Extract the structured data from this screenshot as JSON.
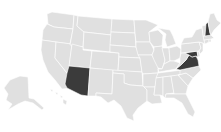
{
  "map": {
    "title": "United States",
    "colors": {
      "background": "#ffffff",
      "default_fill": "#e0e0e0",
      "highlight_fill": "#3b3b3b",
      "border": "#ffffff"
    },
    "highlighted_states": [
      "Arizona",
      "Virginia",
      "Maryland",
      "New Hampshire"
    ],
    "states": [
      {
        "id": "WA",
        "name": "Washington",
        "highlighted": false
      },
      {
        "id": "OR",
        "name": "Oregon",
        "highlighted": false
      },
      {
        "id": "CA",
        "name": "California",
        "highlighted": false
      },
      {
        "id": "NV",
        "name": "Nevada",
        "highlighted": false
      },
      {
        "id": "ID",
        "name": "Idaho",
        "highlighted": false
      },
      {
        "id": "MT",
        "name": "Montana",
        "highlighted": false
      },
      {
        "id": "WY",
        "name": "Wyoming",
        "highlighted": false
      },
      {
        "id": "UT",
        "name": "Utah",
        "highlighted": false
      },
      {
        "id": "AZ",
        "name": "Arizona",
        "highlighted": true
      },
      {
        "id": "CO",
        "name": "Colorado",
        "highlighted": false
      },
      {
        "id": "NM",
        "name": "New Mexico",
        "highlighted": false
      },
      {
        "id": "ND",
        "name": "North Dakota",
        "highlighted": false
      },
      {
        "id": "SD",
        "name": "South Dakota",
        "highlighted": false
      },
      {
        "id": "NE",
        "name": "Nebraska",
        "highlighted": false
      },
      {
        "id": "KS",
        "name": "Kansas",
        "highlighted": false
      },
      {
        "id": "OK",
        "name": "Oklahoma",
        "highlighted": false
      },
      {
        "id": "TX",
        "name": "Texas",
        "highlighted": false
      },
      {
        "id": "MN",
        "name": "Minnesota",
        "highlighted": false
      },
      {
        "id": "IA",
        "name": "Iowa",
        "highlighted": false
      },
      {
        "id": "MO",
        "name": "Missouri",
        "highlighted": false
      },
      {
        "id": "AR",
        "name": "Arkansas",
        "highlighted": false
      },
      {
        "id": "LA",
        "name": "Louisiana",
        "highlighted": false
      },
      {
        "id": "WI",
        "name": "Wisconsin",
        "highlighted": false
      },
      {
        "id": "IL",
        "name": "Illinois",
        "highlighted": false
      },
      {
        "id": "MI",
        "name": "Michigan",
        "highlighted": false
      },
      {
        "id": "IN",
        "name": "Indiana",
        "highlighted": false
      },
      {
        "id": "OH",
        "name": "Ohio",
        "highlighted": false
      },
      {
        "id": "KY",
        "name": "Kentucky",
        "highlighted": false
      },
      {
        "id": "TN",
        "name": "Tennessee",
        "highlighted": false
      },
      {
        "id": "MS",
        "name": "Mississippi",
        "highlighted": false
      },
      {
        "id": "AL",
        "name": "Alabama",
        "highlighted": false
      },
      {
        "id": "GA",
        "name": "Georgia",
        "highlighted": false
      },
      {
        "id": "FL",
        "name": "Florida",
        "highlighted": false
      },
      {
        "id": "SC",
        "name": "South Carolina",
        "highlighted": false
      },
      {
        "id": "NC",
        "name": "North Carolina",
        "highlighted": false
      },
      {
        "id": "VA",
        "name": "Virginia",
        "highlighted": true
      },
      {
        "id": "WV",
        "name": "West Virginia",
        "highlighted": false
      },
      {
        "id": "MD",
        "name": "Maryland",
        "highlighted": true
      },
      {
        "id": "DE",
        "name": "Delaware",
        "highlighted": false
      },
      {
        "id": "PA",
        "name": "Pennsylvania",
        "highlighted": false
      },
      {
        "id": "NJ",
        "name": "New Jersey",
        "highlighted": false
      },
      {
        "id": "NY",
        "name": "New York",
        "highlighted": false
      },
      {
        "id": "CT",
        "name": "Connecticut",
        "highlighted": false
      },
      {
        "id": "RI",
        "name": "Rhode Island",
        "highlighted": false
      },
      {
        "id": "MA",
        "name": "Massachusetts",
        "highlighted": false
      },
      {
        "id": "VT",
        "name": "Vermont",
        "highlighted": false
      },
      {
        "id": "NH",
        "name": "New Hampshire",
        "highlighted": true
      },
      {
        "id": "ME",
        "name": "Maine",
        "highlighted": false
      },
      {
        "id": "AK",
        "name": "Alaska",
        "highlighted": false
      },
      {
        "id": "HI",
        "name": "Hawaii",
        "highlighted": false
      }
    ]
  }
}
